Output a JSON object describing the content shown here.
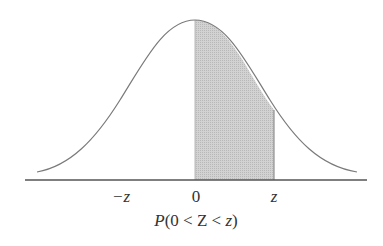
{
  "figure": {
    "type": "standard-normal-curve",
    "shaded_region": {
      "from": "0",
      "to": "z",
      "color": "#c8c8c8"
    },
    "curve_color": "#7a7a7a",
    "axis_color": "#555555",
    "tick_labels": {
      "neg_z": "−z",
      "zero": "0",
      "pos_z": "z"
    },
    "caption": {
      "p": "P",
      "open": "(0 < ",
      "Z": "Z",
      "lt": " < ",
      "z": "z",
      "close": ")"
    }
  }
}
